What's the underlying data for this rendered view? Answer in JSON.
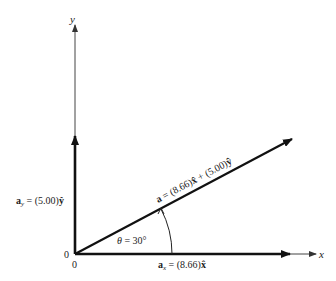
{
  "diagram": {
    "axes": {
      "x_label": "x",
      "y_label": "y",
      "origin_x_label": "0",
      "origin_y_label": "0"
    },
    "vector_a": {
      "symbol": "a",
      "equals": " = (8.66)",
      "xhat": "x̂",
      "plus": " + (5.00)",
      "yhat": "ŷ",
      "full_label": "a = (8.66)x̂ + (5.00)ŷ"
    },
    "component_x": {
      "symbol": "a",
      "subscript": "x",
      "equals": " = (8.66)",
      "hat": "x̂",
      "full_label": "a_x = (8.66)x̂"
    },
    "component_y": {
      "symbol": "a",
      "subscript": "y",
      "equals": " = (5.00)",
      "hat": "ŷ",
      "full_label": "a_y = (5.00)ŷ"
    },
    "angle": {
      "symbol": "θ",
      "text": " = 30°",
      "degrees": 30
    },
    "colors": {
      "ink": "#111111",
      "axis": "#444444",
      "background": "#ffffff"
    }
  }
}
